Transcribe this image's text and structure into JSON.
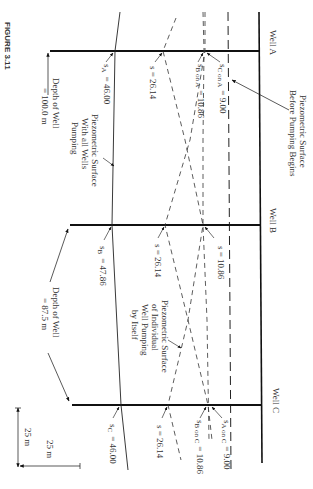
{
  "figure": {
    "label": "FIGURE 3.11"
  },
  "wells": [
    {
      "name": "Well A",
      "label": "Well A",
      "depth_label": "Depth of Well",
      "depth_value": "= 100.0 m",
      "total_drawdown": "s_A = 46.00",
      "total_sub": "A",
      "total_value": "= 46.00"
    },
    {
      "name": "Well B",
      "label": "Well B",
      "depth_label": "Depth of Well",
      "depth_value": "= 87.5 m",
      "total_drawdown": "s_B = 47.86",
      "total_sub": "B",
      "total_value": "= 47.86"
    },
    {
      "name": "Well C",
      "label": "Well C",
      "total_drawdown": "s_C = 46.00",
      "total_sub": "C",
      "total_value": "= 46.00"
    }
  ],
  "drawdowns": {
    "well_a_self": "s = 26.14",
    "well_a_from_b": {
      "sym": "s",
      "sub": "B on A",
      "value": "= 10.86"
    },
    "well_a_from_c": {
      "sym": "s",
      "sub": "C on A",
      "value": "= 9.00"
    },
    "well_b_self": "s = 26.14",
    "well_b_from_ac": "s = 10.86",
    "well_c_self": "s = 26.14",
    "well_c_from_b": {
      "sym": "s",
      "sub": "B on C",
      "value": "= 10.86"
    },
    "well_c_from_a": {
      "sym": "s",
      "sub": "A on C",
      "value": "= 9.00"
    }
  },
  "annotations": {
    "before_pumping": [
      "Piezometric Surface",
      "Before Pumping Begins"
    ],
    "all_wells": [
      "Piezometric Surface",
      "With all Wells",
      "Pumping"
    ],
    "individual": [
      "Piezometric Surface",
      "of Individual",
      "Well Pumping",
      "by Itself"
    ]
  },
  "scale": {
    "horizontal": "25 m",
    "vertical": "25 m"
  }
}
